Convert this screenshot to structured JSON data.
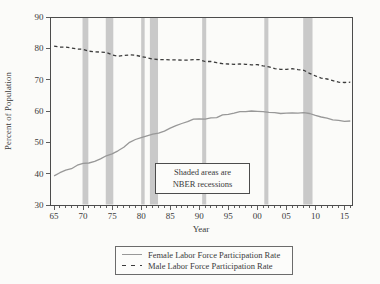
{
  "figure": {
    "background": "#fbfbf9",
    "frame_color": "#4c4c4c",
    "tick_color": "#4c4c4c",
    "text_color": "#3a3a3a",
    "band_color": "#c9c9c9"
  },
  "chart_data": {
    "type": "line",
    "title": "",
    "xlabel": "Year",
    "ylabel": "Percent of Population",
    "xlim": [
      1964.3,
      2016.3
    ],
    "ylim": [
      30,
      90
    ],
    "grid": false,
    "legend_position": "bottom-center",
    "x_tick_years": [
      1965,
      1970,
      1975,
      1980,
      1985,
      1990,
      1995,
      2000,
      2005,
      2010,
      2015
    ],
    "x_tick_labels": [
      "65",
      "70",
      "75",
      "80",
      "85",
      "90",
      "95",
      "00",
      "05",
      "10",
      "15"
    ],
    "y_ticks": [
      30,
      40,
      50,
      60,
      70,
      80,
      90
    ],
    "years": [
      1965,
      1966,
      1967,
      1968,
      1969,
      1970,
      1971,
      1972,
      1973,
      1974,
      1975,
      1976,
      1977,
      1978,
      1979,
      1980,
      1981,
      1982,
      1983,
      1984,
      1985,
      1986,
      1987,
      1988,
      1989,
      1990,
      1991,
      1992,
      1993,
      1994,
      1995,
      1996,
      1997,
      1998,
      1999,
      2000,
      2001,
      2002,
      2003,
      2004,
      2005,
      2006,
      2007,
      2008,
      2009,
      2010,
      2011,
      2012,
      2013,
      2014,
      2015,
      2016
    ],
    "series": [
      {
        "name": "Female Labor Force Participation Rate",
        "line_style": "solid",
        "color": "#989898",
        "values": [
          39.3,
          40.3,
          41.1,
          41.6,
          42.7,
          43.3,
          43.4,
          43.9,
          44.7,
          45.7,
          46.3,
          47.3,
          48.4,
          50.0,
          50.9,
          51.5,
          52.1,
          52.6,
          52.9,
          53.6,
          54.5,
          55.3,
          56.0,
          56.6,
          57.4,
          57.5,
          57.4,
          57.8,
          57.9,
          58.8,
          58.9,
          59.3,
          59.8,
          59.8,
          60.0,
          59.9,
          59.8,
          59.6,
          59.5,
          59.2,
          59.3,
          59.4,
          59.3,
          59.5,
          59.2,
          58.6,
          58.1,
          57.7,
          57.2,
          57.0,
          56.7,
          56.8
        ]
      },
      {
        "name": "Male Labor Force Participation Rate",
        "line_style": "dashed",
        "color": "#3b3b3b",
        "values": [
          80.7,
          80.4,
          80.4,
          80.1,
          79.8,
          79.7,
          79.1,
          78.9,
          78.8,
          78.7,
          77.9,
          77.5,
          77.7,
          77.9,
          77.8,
          77.4,
          77.0,
          76.6,
          76.4,
          76.4,
          76.3,
          76.3,
          76.2,
          76.2,
          76.4,
          76.4,
          75.8,
          75.8,
          75.4,
          75.1,
          75.0,
          74.9,
          75.0,
          74.9,
          74.7,
          74.8,
          74.4,
          74.1,
          73.5,
          73.3,
          73.3,
          73.5,
          73.2,
          73.0,
          72.0,
          71.2,
          70.5,
          70.2,
          69.7,
          69.2,
          69.1,
          69.2
        ]
      }
    ],
    "recession_bands": [
      [
        1969.9,
        1970.9
      ],
      [
        1973.9,
        1975.2
      ],
      [
        1980.0,
        1980.6
      ],
      [
        1981.5,
        1982.9
      ],
      [
        1990.5,
        1991.2
      ],
      [
        2001.2,
        2001.9
      ],
      [
        2007.9,
        2009.5
      ]
    ],
    "annotation": {
      "line1": "Shaded areas are",
      "line2": "NBER recessions"
    }
  }
}
